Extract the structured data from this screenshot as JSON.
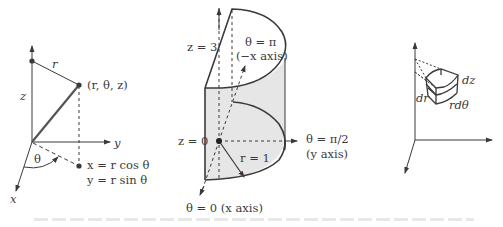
{
  "figure": {
    "panels": [
      {
        "id": "cylindrical-point",
        "labels": {
          "r_segment": "r",
          "z_axis_label": "z",
          "y_axis": "y",
          "x_axis": "x",
          "point": "(r, θ, z)",
          "theta": "θ",
          "x_eq": "x = r cos θ",
          "y_eq": "y = r sin θ"
        }
      },
      {
        "id": "half-cylinder",
        "labels": {
          "z3": "z = 3",
          "z0": "z = 0",
          "theta_pi": "θ = π",
          "neg_x_axis": "(−x axis)",
          "theta_pi2": "θ = π/2",
          "y_axis": "(y axis)",
          "r1": "r = 1",
          "theta0": "θ = 0 (x axis)"
        }
      },
      {
        "id": "volume-element",
        "labels": {
          "dz": "dz",
          "dr": "dr",
          "rdtheta": "rdθ"
        }
      }
    ],
    "colors": {
      "line": "#3a3a3a",
      "shade": "#e6e6e6",
      "background": "#ffffff"
    }
  }
}
